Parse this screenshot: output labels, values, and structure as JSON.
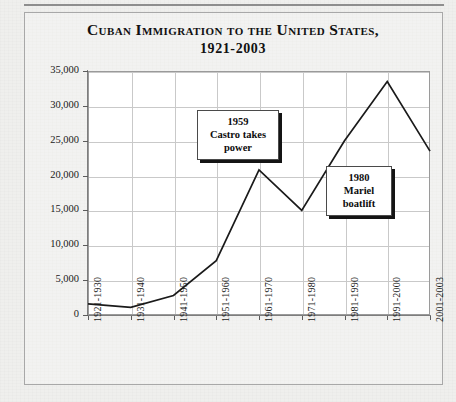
{
  "chart_data": {
    "type": "line",
    "title": "Cuban Immigration to the United States,",
    "subtitle": "1921-2003",
    "xlabel": "",
    "ylabel": "Average immigrants per year",
    "categories": [
      "1921-1930",
      "1931-1940",
      "1941-1950",
      "1951-1960",
      "1961-1970",
      "1971-1980",
      "1981-1990",
      "1991-2000",
      "2001-2003"
    ],
    "values": [
      1600,
      1100,
      2800,
      7800,
      20800,
      15000,
      25000,
      33500,
      23500
    ],
    "ylim": [
      0,
      35000
    ],
    "yticks": [
      0,
      5000,
      10000,
      15000,
      20000,
      25000,
      30000,
      35000
    ],
    "ytick_labels": [
      "0",
      "5,000",
      "10,000",
      "15,000",
      "20,000",
      "25,000",
      "30,000",
      "35,000"
    ],
    "grid": true,
    "legend": false,
    "line_color": "#1a1a1a",
    "annotations": [
      {
        "id": "castro",
        "lines": [
          "1959",
          "Castro takes",
          "power"
        ]
      },
      {
        "id": "mariel",
        "lines": [
          "1980",
          "Mariel",
          "boatlift"
        ]
      }
    ]
  },
  "colors": {
    "background": "#efefed",
    "plot_background": "#ffffff",
    "gridline": "#c9c9c9",
    "axis": "#7d7d7d",
    "text": "#111111",
    "line": "#1a1a1a",
    "shadow": "#141414"
  }
}
